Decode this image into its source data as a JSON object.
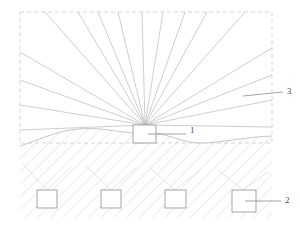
{
  "figure": {
    "stroke_color": "#b9b9b9",
    "label_color": "#4a4a4a",
    "frame_color": "#cccccc",
    "hatch_color": "#cfcfcf",
    "background": "#ffffff",
    "frame": {
      "x": 20,
      "y": 12,
      "width": 252,
      "height": 131,
      "style": "dashed"
    }
  },
  "labels": [
    {
      "id": "1",
      "text": "1",
      "meaning": "source-unit",
      "x": 190,
      "y": 131,
      "leader": {
        "x1": 148,
        "y1": 134,
        "x2": 186,
        "y2": 134
      }
    },
    {
      "id": "2",
      "text": "2",
      "meaning": "buried-unit",
      "x": 285,
      "y": 201,
      "leader": {
        "x1": 245,
        "y1": 201,
        "x2": 281,
        "y2": 201
      }
    },
    {
      "id": "3",
      "text": "3",
      "meaning": "ray-fan",
      "x": 287,
      "y": 92,
      "leader": {
        "x1": 243,
        "y1": 96,
        "x2": 283,
        "y2": 92
      }
    }
  ],
  "source_box": {
    "name": "source-unit-box",
    "x": 133,
    "y": 125,
    "width": 23,
    "height": 18
  },
  "buried_boxes": [
    {
      "name": "buried-unit-1",
      "x": 37,
      "y": 190,
      "width": 20,
      "height": 18
    },
    {
      "name": "buried-unit-2",
      "x": 101,
      "y": 190,
      "width": 20,
      "height": 18
    },
    {
      "name": "buried-unit-3",
      "x": 165,
      "y": 190,
      "width": 21,
      "height": 18
    },
    {
      "name": "buried-unit-4",
      "x": 232,
      "y": 190,
      "width": 24,
      "height": 22
    }
  ],
  "ray_fan": {
    "name": "ray-fan",
    "origin": {
      "x": 145,
      "y": 125
    },
    "count": 17,
    "endpoints": [
      {
        "x": 20,
        "y": 130
      },
      {
        "x": 20,
        "y": 105
      },
      {
        "x": 20,
        "y": 80
      },
      {
        "x": 20,
        "y": 52
      },
      {
        "x": 45,
        "y": 12
      },
      {
        "x": 78,
        "y": 12
      },
      {
        "x": 98,
        "y": 12
      },
      {
        "x": 118,
        "y": 12
      },
      {
        "x": 142,
        "y": 12
      },
      {
        "x": 163,
        "y": 12
      },
      {
        "x": 185,
        "y": 12
      },
      {
        "x": 207,
        "y": 12
      },
      {
        "x": 245,
        "y": 12
      },
      {
        "x": 272,
        "y": 48
      },
      {
        "x": 272,
        "y": 75
      },
      {
        "x": 272,
        "y": 100
      },
      {
        "x": 272,
        "y": 127
      }
    ]
  },
  "ground": {
    "name": "ground-surface",
    "path": "M 20 146 C 40 140, 55 131, 78 129 C 100 127, 118 132, 133 133 L 156 133 C 172 136, 186 143, 200 143 C 220 143, 245 137, 272 136",
    "fill_bottom": 218
  },
  "buried_links": [
    {
      "from": {
        "x": 47,
        "y": 190
      },
      "to": {
        "x": 22,
        "y": 163
      }
    },
    {
      "from": {
        "x": 47,
        "y": 190
      },
      "to": {
        "x": 72,
        "y": 166
      }
    },
    {
      "from": {
        "x": 111,
        "y": 190
      },
      "to": {
        "x": 86,
        "y": 166
      }
    },
    {
      "from": {
        "x": 111,
        "y": 190
      },
      "to": {
        "x": 136,
        "y": 168
      }
    },
    {
      "from": {
        "x": 175,
        "y": 190
      },
      "to": {
        "x": 150,
        "y": 168
      }
    },
    {
      "from": {
        "x": 175,
        "y": 190
      },
      "to": {
        "x": 200,
        "y": 170
      }
    },
    {
      "from": {
        "x": 243,
        "y": 190
      },
      "to": {
        "x": 218,
        "y": 170
      }
    },
    {
      "from": {
        "x": 243,
        "y": 190
      },
      "to": {
        "x": 268,
        "y": 172
      }
    }
  ]
}
